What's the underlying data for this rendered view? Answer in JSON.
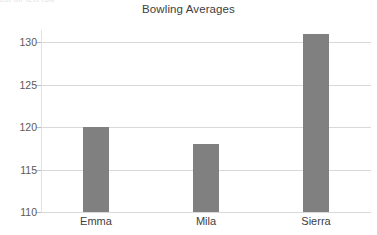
{
  "chart_data": {
    "type": "bar",
    "title": "Bowling Averages",
    "categories": [
      "Emma",
      "Mila",
      "Sierra"
    ],
    "values": [
      120,
      118,
      131
    ],
    "xlabel": "",
    "ylabel": "",
    "ylim": [
      110,
      132
    ],
    "yticks": [
      110,
      115,
      120,
      125,
      130
    ],
    "ytick_labels": [
      "110",
      "115",
      "120",
      "125",
      "130"
    ],
    "grid": true,
    "legend": false,
    "bar_color": "#808080",
    "gridline_color": "#d9d9d9",
    "title_color": "#404040",
    "tick_label_color": "#5a5a5a",
    "background_color": "#ffffff"
  },
  "artifacts": {
    "top_clipped_text": "cut off text row"
  }
}
